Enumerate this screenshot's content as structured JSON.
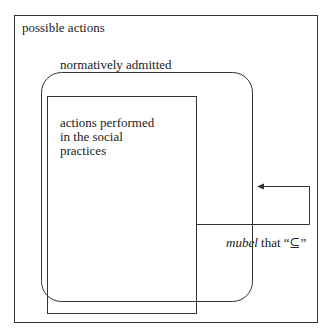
{
  "diagram": {
    "outer_box": {
      "label": "possible actions"
    },
    "rounded_box": {
      "label": "normatively admitted"
    },
    "inner_box": {
      "label_lines": [
        "actions performed",
        "in the social",
        "practices"
      ]
    },
    "arrow": {
      "label_italic": "mubel",
      "label_rest": " that “⊆”"
    },
    "colors": {
      "stroke": "#333333",
      "background": "#ffffff",
      "text": "#222222"
    }
  }
}
